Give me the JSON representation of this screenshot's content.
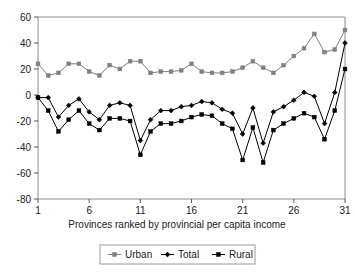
{
  "chart_data": {
    "type": "line",
    "title": "",
    "xlabel": "Provinces ranked by provincial per capita income",
    "ylabel": "",
    "xlim": [
      1,
      31
    ],
    "ylim": [
      -80,
      60
    ],
    "xticks": [
      1,
      6,
      11,
      16,
      21,
      26,
      31
    ],
    "yticks": [
      60,
      40,
      20,
      0,
      -20,
      -40,
      -60,
      -80
    ],
    "grid": false,
    "legend_position": "bottom",
    "x": [
      1,
      2,
      3,
      4,
      5,
      6,
      7,
      8,
      9,
      10,
      11,
      12,
      13,
      14,
      15,
      16,
      17,
      18,
      19,
      20,
      21,
      22,
      23,
      24,
      25,
      26,
      27,
      28,
      29,
      30,
      31
    ],
    "series": [
      {
        "name": "Urban",
        "color": "#808080",
        "marker": "square",
        "values": [
          24,
          15,
          17,
          24,
          24,
          18,
          15,
          23,
          20,
          26,
          26,
          17,
          18,
          18,
          19,
          24,
          18,
          17,
          17,
          18,
          21,
          26,
          21,
          17,
          23,
          30,
          36,
          47,
          33,
          35,
          50
        ]
      },
      {
        "name": "Total",
        "color": "#000000",
        "marker": "diamond",
        "values": [
          -2,
          -2,
          -17,
          -8,
          -3,
          -13,
          -19,
          -8,
          -6,
          -8,
          -35,
          -19,
          -12,
          -12,
          -9,
          -8,
          -5,
          -6,
          -11,
          -14,
          -30,
          -10,
          -37,
          -13,
          -9,
          -4,
          2,
          -1,
          -22,
          2,
          40
        ]
      },
      {
        "name": "Rural",
        "color": "#000000",
        "marker": "square",
        "values": [
          -2,
          -12,
          -28,
          -19,
          -12,
          -22,
          -27,
          -18,
          -18,
          -20,
          -46,
          -28,
          -22,
          -22,
          -20,
          -17,
          -15,
          -16,
          -22,
          -26,
          -50,
          -25,
          -52,
          -27,
          -22,
          -18,
          -14,
          -17,
          -34,
          -12,
          20
        ]
      }
    ]
  },
  "legend": {
    "items": [
      {
        "label": "Urban"
      },
      {
        "label": "Total"
      },
      {
        "label": "Rural"
      }
    ]
  },
  "axis": {
    "x_title": "Provinces ranked by provincial per capita income",
    "y_tick_labels": [
      "60",
      "40",
      "20",
      "0",
      "-20",
      "-40",
      "-60",
      "-80"
    ],
    "x_tick_labels": [
      "1",
      "6",
      "11",
      "16",
      "21",
      "26",
      "31"
    ]
  }
}
